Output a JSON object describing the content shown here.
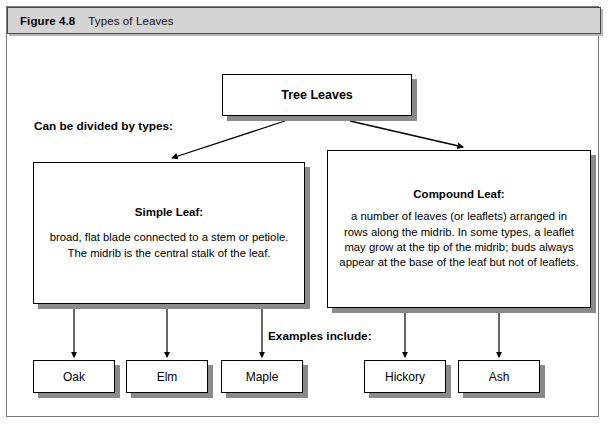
{
  "figure": {
    "number": "Figure 4.8",
    "title": "Types of Leaves"
  },
  "diagram": {
    "type": "hierarchy-flowchart",
    "root": {
      "id": "tree-leaves",
      "label": "Tree Leaves"
    },
    "labels": {
      "divided_by_types": "Can be divided by types:",
      "examples_include": "Examples include:"
    },
    "branches": [
      {
        "id": "simple-leaf",
        "heading": "Simple Leaf:",
        "description": "broad, flat blade connected to a stem or petiole. The midrib is the central stalk of the leaf.",
        "examples": [
          {
            "id": "oak",
            "label": "Oak"
          },
          {
            "id": "elm",
            "label": "Elm"
          },
          {
            "id": "maple",
            "label": "Maple"
          }
        ]
      },
      {
        "id": "compound-leaf",
        "heading": "Compound Leaf:",
        "description": "a number of leaves (or leaflets) arranged in rows along the midrib. In some types, a leaflet may grow at the tip of the midrib; buds always appear at the base of the leaf but not of leaflets.",
        "examples": [
          {
            "id": "hickory",
            "label": "Hickory"
          },
          {
            "id": "ash",
            "label": "Ash"
          }
        ]
      }
    ],
    "colors": {
      "page_background": "#ffffff",
      "caption_bar_fill": "#d4d4d4",
      "box_fill": "#ffffff",
      "box_border": "#000000",
      "box_shadow": "#8a8a8a",
      "connector": "#000000",
      "frame_border": "#7a7a7a"
    }
  }
}
